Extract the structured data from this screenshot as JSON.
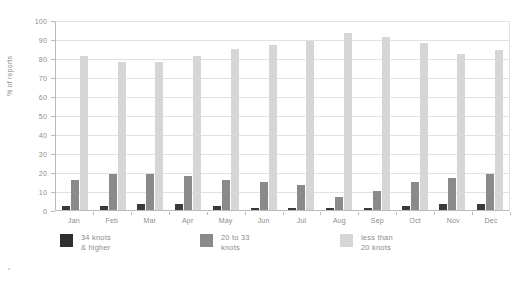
{
  "chart_data": {
    "type": "bar",
    "title": "",
    "xlabel": "",
    "ylabel": "% of reports",
    "ylim": [
      0,
      100
    ],
    "yticks": [
      0,
      10,
      20,
      30,
      40,
      50,
      60,
      70,
      80,
      90,
      100
    ],
    "grid": true,
    "legend_position": "bottom",
    "categories": [
      "Jan",
      "Feb",
      "Mar",
      "Apr",
      "May",
      "Jun",
      "Jul",
      "Aug",
      "Sep",
      "Oct",
      "Nov",
      "Dec"
    ],
    "series": [
      {
        "name": "34 knots & higher",
        "color": "#3a3a3a",
        "values": [
          2,
          2,
          3,
          3,
          2,
          1,
          1,
          1,
          1,
          2,
          3,
          3
        ]
      },
      {
        "name": "20 to 33 knots",
        "color": "#8a8a8a",
        "values": [
          16,
          19,
          19,
          18,
          16,
          15,
          13,
          7,
          10,
          15,
          17,
          19
        ]
      },
      {
        "name": "less than 20 knots",
        "color": "#d6d6d6",
        "values": [
          81,
          78,
          78,
          81,
          85,
          87,
          89,
          93,
          91,
          88,
          82,
          84
        ]
      }
    ]
  },
  "axis": {
    "y_title": "% of reports"
  },
  "legend": {
    "items": [
      {
        "line1": "34 knots",
        "line2": "& higher"
      },
      {
        "line1": "20 to 33",
        "line2": "knots"
      },
      {
        "line1": "less than",
        "line2": "20 knots"
      }
    ]
  }
}
